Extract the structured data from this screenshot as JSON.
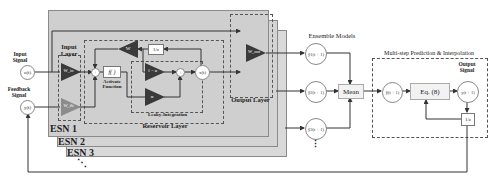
{
  "input": {
    "input_signal_label": "Input Signal",
    "input_node": "u(t)",
    "feedback_signal_label": "Feedback Signal",
    "feedback_node": "y(t)"
  },
  "esn": {
    "stack_labels": [
      "ESN 1",
      "ESN 2",
      "ESN 3"
    ],
    "ellipsis": "⋱",
    "input_layer": {
      "title": "Input Layer",
      "w_in": "W_in",
      "w_fb": "W_fb"
    },
    "reservoir": {
      "title": "Reservoir Layer",
      "sum_symbol": "+",
      "activation": "f( )",
      "activation_caption": "Activate Function",
      "w_recurrent": "W",
      "delay": "1/z",
      "leaky_title": "Leaky-Integration",
      "one_minus_alpha": "1 − α",
      "alpha": "α",
      "leaky_sum_symbol": "+",
      "state_node": "x(t)"
    },
    "output_layer": {
      "title": "Output Layer",
      "w_out": "W_out"
    }
  },
  "ensemble": {
    "title": "Ensemble Models",
    "outputs": [
      "ŷ1(t + 1)",
      "ŷ2(t + 1)",
      "ŷ3(t + 1)"
    ],
    "more": "⋮",
    "mean_label": "Mean"
  },
  "multistep": {
    "title": "Multi-step Prediction & Interpolation",
    "mean_node": "ŷ(t + 1)",
    "equation": "Eq. (8)",
    "output_signal_label": "Output Signal",
    "output_node": "y(t + 1)",
    "delay": "1/z"
  },
  "colors": {
    "esn_fill": "#d6d6d6",
    "triangle_dark": "#3a3a3a",
    "triangle_grey": "#8c8c8c",
    "wire": "#333333"
  }
}
